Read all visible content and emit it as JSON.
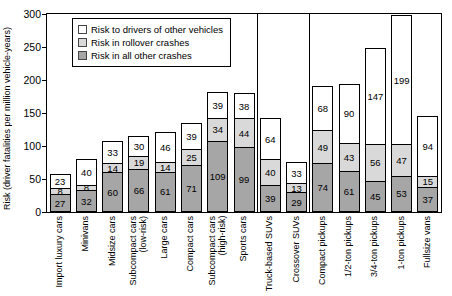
{
  "chart_data": {
    "type": "bar",
    "stacked": true,
    "title": "",
    "xlabel": "",
    "ylabel": "Risk (driver fatalities per million vehicle-years)",
    "ylim": [
      0,
      300
    ],
    "yticks": [
      0,
      50,
      100,
      150,
      200,
      250,
      300
    ],
    "grid": false,
    "legend_position": "top-left",
    "categories": [
      "Import luxury cars",
      "Minivans",
      "Midsize cars",
      "Subcompact cars\n(low-risk)",
      "Large cars",
      "Compact cars",
      "Subcompact cars\n(high-risk)",
      "Sports cars",
      "Truck-based SUVs",
      "Crossover SUVs",
      "Compact pickups",
      "1/2-ton pickups",
      "3/4-ton pickups",
      "1-ton pickups",
      "Fullsize vans"
    ],
    "series": [
      {
        "name": "Risk in all other crashes",
        "color": "#a6a6a6",
        "values": [
          27,
          32,
          60,
          66,
          61,
          71,
          109,
          99,
          39,
          29,
          74,
          61,
          45,
          53,
          37
        ]
      },
      {
        "name": "Risk in rollover crashes",
        "color": "#d9d9d9",
        "values": [
          8,
          8,
          14,
          19,
          14,
          25,
          34,
          44,
          40,
          13,
          49,
          43,
          56,
          47,
          15
        ]
      },
      {
        "name": "Risk to drivers of other vehicles",
        "color": "#ffffff",
        "values": [
          23,
          40,
          33,
          30,
          46,
          39,
          39,
          38,
          64,
          33,
          68,
          90,
          147,
          199,
          94
        ]
      }
    ],
    "totals": [
      58,
      80,
      107,
      115,
      121,
      135,
      182,
      181,
      143,
      75,
      191,
      194,
      248,
      299,
      146
    ],
    "group_divider_after_index": [
      7,
      9
    ],
    "colors": {
      "axis": "#000000",
      "bar_border": "#000000",
      "background": "#ffffff"
    }
  }
}
